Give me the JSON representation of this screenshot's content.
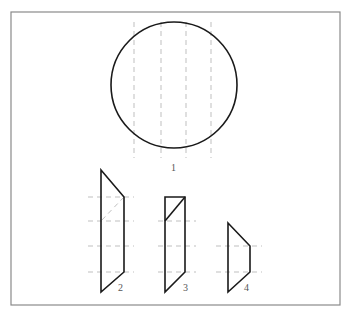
{
  "figure": {
    "labels": {
      "circle": "1",
      "shape2": "2",
      "shape3": "3",
      "shape4": "4"
    },
    "colors": {
      "outline": "#1a1a1a",
      "construction": "#b8b8b8",
      "frame": "#8a8a8a",
      "background": "#ffffff"
    },
    "frame": {
      "x": 11,
      "y": 12,
      "width": 329,
      "height": 293
    },
    "circle": {
      "cx": 174,
      "cy": 85,
      "r": 63
    },
    "vertical_construction_lines_x": [
      134,
      161,
      186,
      211
    ],
    "shapes": [
      {
        "id": "2",
        "points": "101,170 124,197 124,272 101,292",
        "section_diagonal": "124,197 101,221"
      },
      {
        "id": "3",
        "points": "165,197 185,197 185,272 165,292",
        "cut_diagonal": "185,197 165,221"
      },
      {
        "id": "4",
        "points": "228,223 250,246 250,272 228,292"
      }
    ],
    "horizontal_construction_levels_y": [
      197,
      221,
      246,
      272
    ]
  }
}
